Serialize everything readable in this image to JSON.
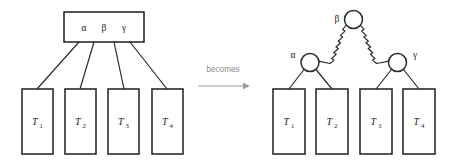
{
  "figure": {
    "background_color": "#ffffff",
    "stroke_color": "#2b2b2b",
    "annotation_color": "#8d8d8d"
  },
  "transition": {
    "label": "becomes",
    "arrow": "right-arrow"
  },
  "before": {
    "node": {
      "keys": [
        "α",
        "β",
        "γ"
      ],
      "key_alpha": "α",
      "key_beta": "β",
      "key_gamma": "γ"
    },
    "children": [
      {
        "label": "T",
        "sub": "1"
      },
      {
        "label": "T",
        "sub": "2"
      },
      {
        "label": "T",
        "sub": "3"
      },
      {
        "label": "T",
        "sub": "4"
      }
    ]
  },
  "after": {
    "nodes": [
      {
        "id": "beta",
        "label": "β",
        "label_side": "left"
      },
      {
        "id": "alpha",
        "label": "α",
        "label_side": "left"
      },
      {
        "id": "gamma",
        "label": "γ",
        "label_side": "right"
      }
    ],
    "children": [
      {
        "label": "T",
        "sub": "1"
      },
      {
        "label": "T",
        "sub": "2"
      },
      {
        "label": "T",
        "sub": "3"
      },
      {
        "label": "T",
        "sub": "4"
      }
    ]
  }
}
